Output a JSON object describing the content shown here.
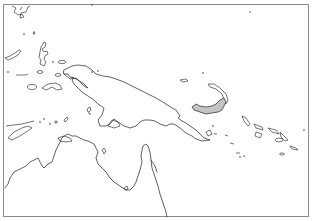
{
  "map": {
    "region": "New Guinea and surrounding islands",
    "highlighted_region": "New Britain",
    "highlight_color": "#c4c4c4",
    "stroke_color": "#3a3a3a",
    "frame_color": "#8a8a8a",
    "background_color": "#ffffff",
    "labels": []
  }
}
